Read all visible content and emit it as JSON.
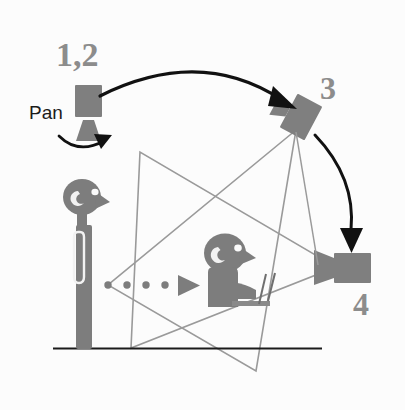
{
  "figure": {
    "background_color": "#fcfcfc"
  },
  "labels": {
    "position_12": "1,2",
    "position_3": "3",
    "position_4": "4",
    "pan": "Pan"
  },
  "colors": {
    "camera_gray": "#7f7f7f",
    "figure_gray": "#7d7d7d",
    "arrow_black": "#111111",
    "frustum_gray": "#9a9a9a",
    "ground_black": "#1b1b1b",
    "label_gray": "#8c8c8c",
    "pan_text_black": "#1b1b1b"
  },
  "elements": {
    "camera_12": {
      "name": "camera-position-1-2",
      "description": "Camera on tripod at starting position, labelled 1,2",
      "x": 88,
      "y": 112
    },
    "camera_3": {
      "name": "camera-position-3",
      "description": "Tilted camera at upper right, labelled 3",
      "x": 301,
      "y": 117
    },
    "camera_4": {
      "name": "camera-position-4",
      "description": "Camera at lower right pointing left, labelled 4",
      "x": 352,
      "y": 270
    },
    "standing_person": {
      "name": "standing-presenter",
      "description": "Standing presenter figure at left facing right",
      "x": 84,
      "y": 250
    },
    "seated_person": {
      "name": "seated-person",
      "description": "Seated person at a desk facing right",
      "x": 232,
      "y": 272
    },
    "gaze_arrow": {
      "name": "gaze-direction-arrow",
      "description": "Dotted arrow from presenter pointing right toward seated person",
      "dots": 4
    },
    "arc_12_to_3": {
      "name": "move-arc-1-2-to-3",
      "description": "Large black arc arrow from camera 1,2 to camera 3"
    },
    "arc_3_to_4": {
      "name": "move-arc-3-to-4",
      "description": "Black arc arrow from camera 3 down to camera 4"
    },
    "pan_arc": {
      "name": "pan-rotation-arrow",
      "description": "Small arc arrow beneath camera 1,2 indicating pan rotation"
    },
    "frustum_a": {
      "name": "view-frustum-a",
      "description": "Gray triangular camera view frustum converging at camera 4"
    },
    "frustum_b": {
      "name": "view-frustum-b",
      "description": "Gray triangular camera view frustum converging at camera 3"
    },
    "ground_line": {
      "name": "ground-line",
      "description": "Horizontal black floor line"
    }
  }
}
